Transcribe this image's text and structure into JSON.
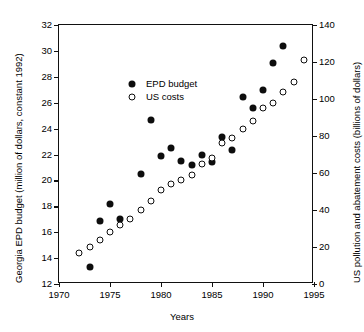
{
  "chart_data": {
    "type": "scatter",
    "title": "",
    "xlabel": "Years",
    "ylabel": "Georgia EPD budget (million of dollars, constant 1992)",
    "y2label": "US pollution and abatement costs (billions of dollars)",
    "xlim": [
      1970,
      1995
    ],
    "ylim": [
      12,
      32
    ],
    "y2lim": [
      0,
      140
    ],
    "xticks": [
      1970,
      1975,
      1980,
      1985,
      1990,
      1995
    ],
    "xticklabels": [
      "1970",
      "1975",
      "1980",
      "1985",
      "1990",
      "1995"
    ],
    "yticks": [
      12,
      14,
      16,
      18,
      20,
      22,
      24,
      26,
      28,
      30,
      32
    ],
    "yticklabels": [
      "12",
      "14",
      "16",
      "18",
      "20",
      "22",
      "24",
      "26",
      "28",
      "30",
      "32"
    ],
    "y2ticks": [
      0,
      20,
      40,
      60,
      80,
      100,
      120,
      140
    ],
    "y2ticklabels": [
      "0",
      "20",
      "40",
      "60",
      "80",
      "100",
      "120",
      "140"
    ],
    "grid": false,
    "legend_position": "upper left",
    "series": [
      {
        "name": "EPD budget",
        "marker": "filled-circle",
        "axis": "left",
        "color": "#0d0d0d",
        "x": [
          1973,
          1974,
          1975,
          1976,
          1978,
          1979,
          1980,
          1981,
          1982,
          1983,
          1984,
          1985,
          1986,
          1987,
          1988,
          1989,
          1990,
          1991,
          1992
        ],
        "values": [
          13.3,
          16.85,
          18.2,
          17.05,
          20.5,
          24.65,
          21.85,
          22.5,
          21.5,
          21.2,
          21.95,
          21.4,
          23.35,
          22.35,
          26.45,
          25.6,
          26.95,
          29.1,
          30.35
        ]
      },
      {
        "name": "US costs",
        "marker": "open-circle",
        "axis": "right",
        "color": "#0d0d0d",
        "x": [
          1972,
          1973,
          1974,
          1975,
          1976,
          1977,
          1978,
          1979,
          1980,
          1981,
          1982,
          1983,
          1984,
          1985,
          1986,
          1987,
          1988,
          1989,
          1990,
          1991,
          1992,
          1993,
          1994
        ],
        "values": [
          17,
          20,
          24,
          28,
          32,
          35,
          40,
          45,
          51,
          54,
          56,
          59,
          65,
          68,
          76,
          79,
          84,
          88,
          95,
          98,
          104,
          109,
          121
        ]
      }
    ]
  },
  "legend": {
    "items": [
      {
        "label": "EPD budget",
        "marker": "filled-circle"
      },
      {
        "label": "US costs",
        "marker": "open-circle"
      }
    ]
  }
}
